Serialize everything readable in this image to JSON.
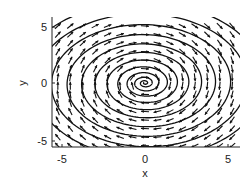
{
  "chart_data": {
    "type": "vector_field",
    "title": "",
    "xlabel": "x",
    "ylabel": "y",
    "xlim": [
      -5.5,
      5.8
    ],
    "ylim": [
      -5.6,
      5.6
    ],
    "xticks": [
      -5,
      0,
      5
    ],
    "yticks": [
      -5,
      0,
      5
    ],
    "xtick_labels": [
      "-5",
      "0",
      "5"
    ],
    "ytick_labels": [
      "-5",
      "0",
      "5"
    ],
    "grid": false,
    "legend": null,
    "field": {
      "form": "dx/dt = y - 0.05x, dy/dt = -x - 0.05y (approximate; clockwise rotation, spiraling inward)",
      "grid_spacing": 0.75,
      "rotation": "clockwise",
      "fixed_point": [
        0,
        0
      ],
      "fixed_point_type": "stable spiral"
    },
    "trajectory": {
      "type": "spiral",
      "center": [
        0,
        0
      ],
      "outer_radius": 7.5,
      "turns": 11
    },
    "colors": {
      "arrows": "#111111",
      "trajectory": "#111111",
      "axes": "#222222",
      "background": "#ffffff"
    }
  },
  "axes": {
    "x_label": "x",
    "y_label": "y",
    "x_ticks": [
      "-5",
      "0",
      "5"
    ],
    "y_ticks": [
      "5",
      "0",
      "-5"
    ]
  }
}
